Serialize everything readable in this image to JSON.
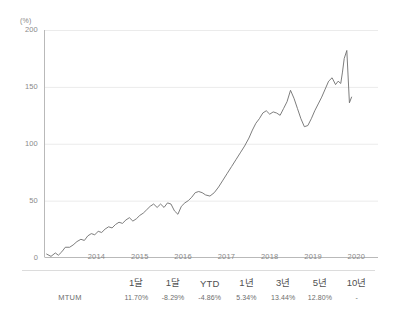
{
  "chart_data": {
    "type": "line",
    "title": "",
    "xlabel": "",
    "ylabel": "",
    "unit_label": "(%)",
    "ylim": [
      0,
      200
    ],
    "yticks": [
      0,
      50,
      100,
      150,
      200
    ],
    "xticks": [
      "2014",
      "2015",
      "2016",
      "2017",
      "2018",
      "2019",
      "2020"
    ],
    "xlim": [
      2013.3,
      2021.0
    ],
    "grid": true,
    "legend": "none",
    "line_color": "#6e6e6e",
    "series": [
      {
        "name": "MTUM",
        "x": [
          2013.35,
          2013.45,
          2013.55,
          2013.62,
          2013.7,
          2013.78,
          2013.88,
          2013.96,
          2014.05,
          2014.14,
          2014.22,
          2014.3,
          2014.38,
          2014.46,
          2014.54,
          2014.62,
          2014.7,
          2014.78,
          2014.86,
          2014.94,
          2015.02,
          2015.1,
          2015.18,
          2015.26,
          2015.34,
          2015.42,
          2015.5,
          2015.58,
          2015.66,
          2015.74,
          2015.82,
          2015.9,
          2015.98,
          2016.06,
          2016.14,
          2016.22,
          2016.3,
          2016.38,
          2016.46,
          2016.54,
          2016.62,
          2016.7,
          2016.78,
          2016.86,
          2016.94,
          2017.02,
          2017.12,
          2017.22,
          2017.32,
          2017.42,
          2017.52,
          2017.62,
          2017.72,
          2017.82,
          2017.92,
          2018.02,
          2018.1,
          2018.18,
          2018.26,
          2018.34,
          2018.42,
          2018.5,
          2018.58,
          2018.66,
          2018.74,
          2018.82,
          2018.9,
          2018.98,
          2019.06,
          2019.14,
          2019.22,
          2019.3,
          2019.38,
          2019.46,
          2019.54,
          2019.62,
          2019.7,
          2019.78,
          2019.86,
          2019.94,
          2020.02,
          2020.08,
          2020.14,
          2020.18,
          2020.22,
          2020.28,
          2020.34
        ],
        "values": [
          3,
          1,
          4,
          2,
          5,
          9,
          9,
          11,
          14,
          16,
          15,
          19,
          21,
          20,
          23,
          22,
          25,
          27,
          26,
          29,
          31,
          30,
          33,
          35,
          32,
          34,
          37,
          39,
          42,
          45,
          47,
          44,
          47,
          44,
          48,
          47,
          41,
          38,
          45,
          48,
          50,
          53,
          57,
          58,
          57,
          55,
          54,
          57,
          62,
          68,
          74,
          80,
          86,
          92,
          98,
          105,
          112,
          118,
          122,
          127,
          129,
          126,
          128,
          127,
          125,
          131,
          137,
          147,
          140,
          131,
          122,
          115,
          116,
          122,
          129,
          135,
          141,
          148,
          155,
          158,
          152,
          155,
          153,
          163,
          175,
          182,
          136
        ],
        "end_value": 141
      }
    ]
  },
  "table": {
    "row_label_header": "",
    "periods": [
      "1달",
      "1달",
      "YTD",
      "1년",
      "3년",
      "5년",
      "10년"
    ],
    "rows": [
      {
        "name": "MTUM",
        "values": [
          "11.70%",
          "-8.29%",
          "-4.86%",
          "5.34%",
          "13.44%",
          "12.80%",
          "-"
        ]
      }
    ]
  }
}
